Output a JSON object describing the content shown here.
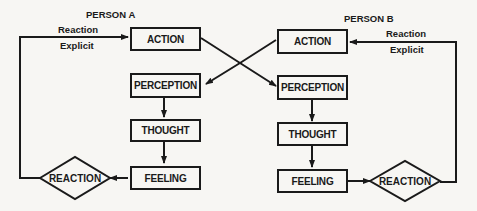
{
  "diagram": {
    "person_a": {
      "title": "PERSON A",
      "reaction_label": "Reaction",
      "explicit_label": "Explicit",
      "nodes": {
        "action": "ACTION",
        "perception": "PERCEPTION",
        "thought": "THOUGHT",
        "feeling": "FEELING",
        "reaction": "REACTION"
      }
    },
    "person_b": {
      "title": "PERSON B",
      "reaction_label": "Reaction",
      "explicit_label": "Explicit",
      "nodes": {
        "action": "ACTION",
        "perception": "PERCEPTION",
        "thought": "THOUGHT",
        "feeling": "FEELING",
        "reaction": "REACTION"
      }
    },
    "colors": {
      "line": "#1a1a1a",
      "background": "#f7f6f3"
    }
  }
}
